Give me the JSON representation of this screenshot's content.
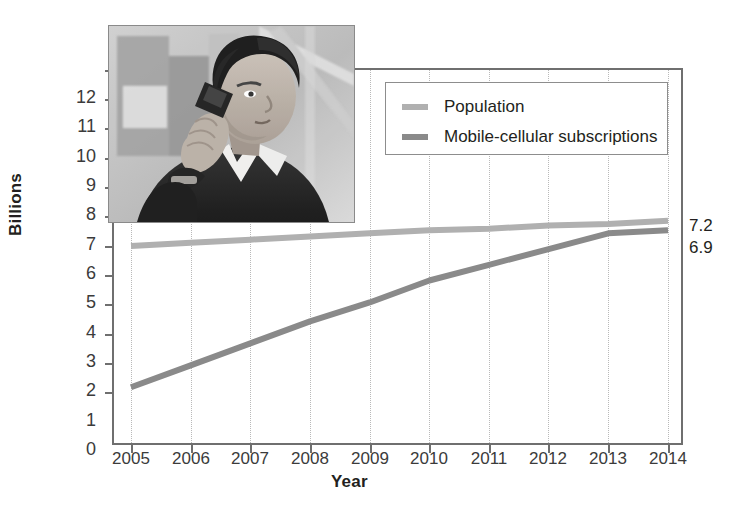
{
  "chart_data": {
    "type": "line",
    "title": "",
    "xlabel": "Year",
    "ylabel": "Billions",
    "x": [
      2005,
      2006,
      2007,
      2008,
      2009,
      2010,
      2011,
      2012,
      2013,
      2014
    ],
    "categories": [
      "2005",
      "2006",
      "2007",
      "2008",
      "2009",
      "2010",
      "2011",
      "2012",
      "2013",
      "2014"
    ],
    "xlim": [
      2005,
      2014
    ],
    "ylim": [
      0,
      12
    ],
    "yticks": [
      0,
      1,
      2,
      3,
      4,
      5,
      6,
      7,
      8,
      9,
      10,
      11,
      12
    ],
    "ytick_labels": [
      "0",
      "1",
      "2",
      "3",
      "4",
      "5",
      "6",
      "7",
      "8",
      "9",
      "10",
      "11",
      "12"
    ],
    "grid": "vertical-dotted",
    "legend_position": "top-right-inside",
    "series": [
      {
        "name": "Population",
        "color": "#b0b0b0",
        "values": [
          6.4,
          6.5,
          6.6,
          6.7,
          6.8,
          6.9,
          6.95,
          7.05,
          7.1,
          7.2
        ],
        "end_label": "7.2"
      },
      {
        "name": "Mobile-cellular subscriptions",
        "color": "#8a8a8a",
        "values": [
          1.9,
          2.6,
          3.3,
          4.0,
          4.6,
          5.3,
          5.8,
          6.3,
          6.8,
          6.9
        ],
        "end_label": "6.9"
      }
    ],
    "annotations": [
      {
        "text": "7.2",
        "series": "Population",
        "at_x": 2014
      },
      {
        "text": "6.9",
        "series": "Mobile-cellular subscriptions",
        "at_x": 2014
      }
    ]
  },
  "legend": {
    "items": [
      {
        "label": "Population",
        "color": "#b0b0b0"
      },
      {
        "label": "Mobile-cellular subscriptions",
        "color": "#8a8a8a"
      }
    ]
  },
  "photo": {
    "alt": "man-using-mobile-phone-photo"
  },
  "colors": {
    "axis": "#6f6f6f",
    "grid": "#b9b9b9",
    "text": "#231f20",
    "population": "#b0b0b0",
    "mobile": "#8a8a8a"
  }
}
